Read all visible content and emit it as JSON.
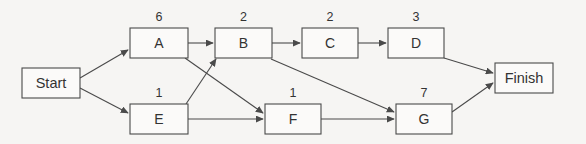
{
  "diagram": {
    "type": "activity-on-node network",
    "background_color": "#f6f5f3",
    "line_color": "#4a4a4a",
    "text_color": "#333333",
    "nodes": [
      {
        "id": "start",
        "label": "Start",
        "duration": "",
        "x": 22,
        "y": 68,
        "w": 58,
        "h": 30,
        "terminal": true
      },
      {
        "id": "a",
        "label": "A",
        "duration": "6",
        "x": 130,
        "y": 28,
        "w": 58,
        "h": 30,
        "terminal": false
      },
      {
        "id": "b",
        "label": "B",
        "duration": "2",
        "x": 215,
        "y": 28,
        "w": 57,
        "h": 30,
        "terminal": false
      },
      {
        "id": "c",
        "label": "C",
        "duration": "2",
        "x": 302,
        "y": 28,
        "w": 56,
        "h": 30,
        "terminal": false
      },
      {
        "id": "d",
        "label": "D",
        "duration": "3",
        "x": 388,
        "y": 28,
        "w": 56,
        "h": 30,
        "terminal": false
      },
      {
        "id": "e",
        "label": "E",
        "duration": "1",
        "x": 130,
        "y": 104,
        "w": 58,
        "h": 30,
        "terminal": false
      },
      {
        "id": "f",
        "label": "F",
        "duration": "1",
        "x": 265,
        "y": 104,
        "w": 56,
        "h": 30,
        "terminal": false
      },
      {
        "id": "g",
        "label": "G",
        "duration": "7",
        "x": 396,
        "y": 104,
        "w": 56,
        "h": 30,
        "terminal": false
      },
      {
        "id": "finish",
        "label": "Finish",
        "duration": "",
        "x": 495,
        "y": 63,
        "w": 58,
        "h": 30,
        "terminal": true
      }
    ],
    "edges": [
      {
        "id": "start-a",
        "from": "start",
        "to": "a",
        "x1": 80,
        "y1": 78,
        "x2": 128,
        "y2": 50
      },
      {
        "id": "start-e",
        "from": "start",
        "to": "e",
        "x1": 80,
        "y1": 88,
        "x2": 128,
        "y2": 113
      },
      {
        "id": "a-b",
        "from": "a",
        "to": "b",
        "x1": 188,
        "y1": 43,
        "x2": 213,
        "y2": 43
      },
      {
        "id": "a-f",
        "from": "a",
        "to": "f",
        "x1": 185,
        "y1": 58,
        "x2": 263,
        "y2": 113
      },
      {
        "id": "e-b",
        "from": "e",
        "to": "b",
        "x1": 186,
        "y1": 104,
        "x2": 216,
        "y2": 59
      },
      {
        "id": "e-f",
        "from": "e",
        "to": "f",
        "x1": 188,
        "y1": 119,
        "x2": 263,
        "y2": 119
      },
      {
        "id": "b-c",
        "from": "b",
        "to": "c",
        "x1": 272,
        "y1": 43,
        "x2": 300,
        "y2": 43
      },
      {
        "id": "b-g",
        "from": "b",
        "to": "g",
        "x1": 271,
        "y1": 59,
        "x2": 394,
        "y2": 112
      },
      {
        "id": "c-d",
        "from": "c",
        "to": "d",
        "x1": 358,
        "y1": 43,
        "x2": 386,
        "y2": 43
      },
      {
        "id": "d-finish",
        "from": "d",
        "to": "finish",
        "x1": 444,
        "y1": 58,
        "x2": 493,
        "y2": 73
      },
      {
        "id": "f-g",
        "from": "f",
        "to": "g",
        "x1": 321,
        "y1": 119,
        "x2": 394,
        "y2": 119
      },
      {
        "id": "g-finish",
        "from": "g",
        "to": "finish",
        "x1": 452,
        "y1": 112,
        "x2": 493,
        "y2": 83
      }
    ]
  }
}
